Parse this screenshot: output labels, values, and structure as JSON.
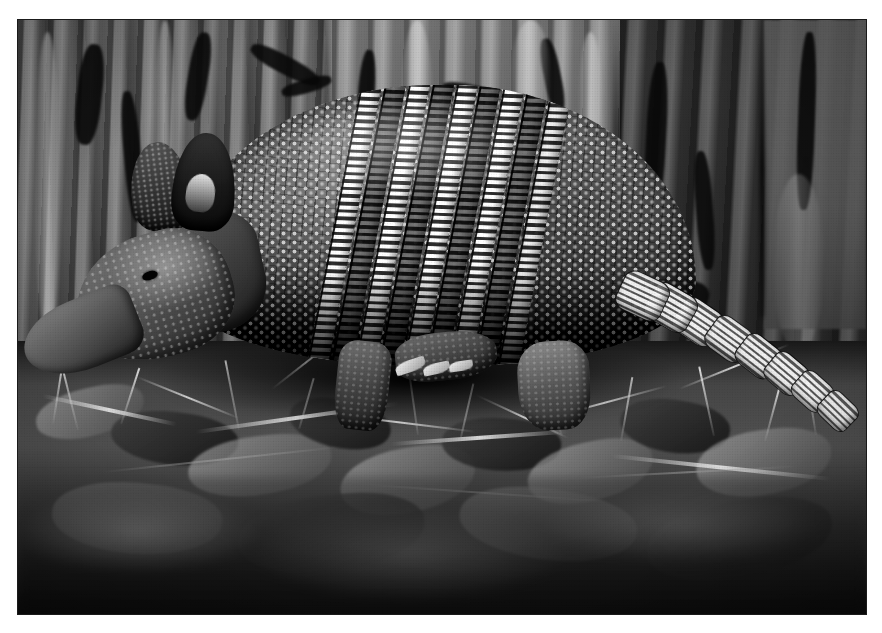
{
  "image": {
    "kind": "photograph",
    "medium": "halftone print scan",
    "color_mode": "grayscale",
    "orientation": "landscape",
    "width_px": 882,
    "height_px": 633,
    "page_background": "#ffffff",
    "border_color": "#1a1a1a",
    "frame": {
      "left": 17,
      "top": 19,
      "width": 850,
      "height": 596
    },
    "caption": "",
    "title": ""
  },
  "subject": {
    "common_name": "Nine-banded armadillo",
    "pose": "walking left in profile",
    "band_count": 9,
    "features": [
      "domed bony carapace with rosette scutes",
      "nine hinged movable bands across midsection",
      "long tapered snout",
      "large upright ears",
      "small dark eye",
      "clawed front feet",
      "long ringed armored tail"
    ]
  },
  "scene": {
    "background": "rough furrowed tree bark trunk",
    "foreground": "dry leaf litter, twigs and grass blades",
    "lighting": "bright directional light from upper left",
    "depth_of_field": "foreground bottom strip blurred"
  },
  "palette": {
    "paper_white": "#ffffff",
    "border": "#1a1a1a",
    "bark_light": "#908d86",
    "bark_mid": "#6d6a64",
    "bark_dark": "#36342f",
    "shell_highlight": "#f2efe7",
    "shell_mid": "#4e4b47",
    "shell_shadow": "#1b1a19",
    "ground_mid": "#595650",
    "ground_dark": "#232220",
    "twig_light": "#e2ded4"
  }
}
